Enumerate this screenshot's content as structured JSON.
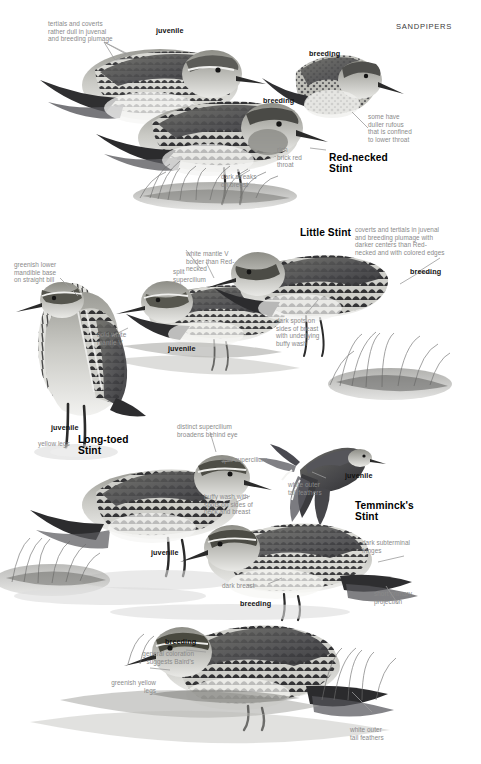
{
  "page": {
    "header": "SANDPIPERS",
    "width": 481,
    "height": 764,
    "palette": {
      "annotation_gray": "#8a8a8a",
      "label_black": "#111111",
      "background": "#ffffff",
      "plate_gray": "#9a9a9a"
    }
  },
  "species": [
    {
      "name": "Red-necked\nStint"
    },
    {
      "name": "Little Stint"
    },
    {
      "name": "Long-toed\nStint"
    },
    {
      "name": "Temminck's\nStint"
    }
  ],
  "plumage_labels": [
    {
      "text": "juvenile"
    },
    {
      "text": "breeding"
    },
    {
      "text": "breeding"
    },
    {
      "text": "juvenile"
    },
    {
      "text": "breeding"
    },
    {
      "text": "juvenile"
    },
    {
      "text": "juvenile"
    },
    {
      "text": "juvenile"
    },
    {
      "text": "breeding"
    },
    {
      "text": "breeding"
    }
  ],
  "annotations": [
    {
      "id": "tertials-coverts-dull",
      "text": "tertials and coverts\nrather dull in juvenal\nand breeding plumage"
    },
    {
      "id": "duller-rufous",
      "text": "some have\nduller rufous\nthat is confined\nto lower throat"
    },
    {
      "id": "rich-brick-red-throat",
      "text": "rich\nbrick red\nthroat"
    },
    {
      "id": "dark-streaks-breast",
      "text": "dark streaks\non breast"
    },
    {
      "id": "coverts-tertials-darker",
      "text": "coverts and tertials in juvenal\nand breeding plumage with\ndarker centers than Red-\nnecked and with colored edges"
    },
    {
      "id": "white-mantle-v-bolder",
      "text": "white mantle V\nbolder than Red-\nnecked"
    },
    {
      "id": "split-supercilium-little",
      "text": "split\nsupercilium"
    },
    {
      "id": "greenish-lower-mandible",
      "text": "greenish lower\nmandible base\non straight bill"
    },
    {
      "id": "bold-white-mantle-v",
      "text": "bold white\nmantle V"
    },
    {
      "id": "dark-spots-sides-breast",
      "text": "dark spots on\nsides of breast\nwith underlying\nbuffy wash"
    },
    {
      "id": "yellow-legs",
      "text": "yellow legs"
    },
    {
      "id": "distinct-supercilium",
      "text": "distinct supercilium\nbroadens behind eye"
    },
    {
      "id": "split-supercilium-longtoed",
      "text": "split supercilium"
    },
    {
      "id": "buffy-wash-spots",
      "text": "buffy wash with\nspots on sides of\nneck and breast"
    },
    {
      "id": "white-outer-tail-feathers-temminck",
      "text": "white outer\ntail feathers"
    },
    {
      "id": "dark-subterminal-fringes",
      "text": "dark subterminal\nfringes"
    },
    {
      "id": "dark-breast",
      "text": "dark breast"
    },
    {
      "id": "short-primary-projection",
      "text": "short primary\nprojection"
    },
    {
      "id": "general-coloration-bairds",
      "text": "general coloration\nsuggests Baird's"
    },
    {
      "id": "greenish-yellow-legs",
      "text": "greenish yellow\nlegs"
    },
    {
      "id": "white-outer-tail-feathers-bottom",
      "text": "white outer\ntail feathers"
    }
  ]
}
